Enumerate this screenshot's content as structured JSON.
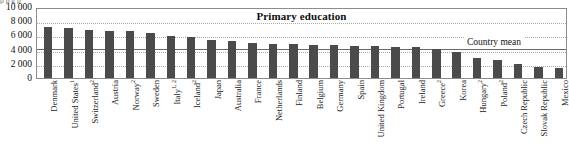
{
  "figure": {
    "top_clipped_text": "p        p                    g          p",
    "mean_label": "Country mean"
  },
  "chart_data": {
    "type": "bar",
    "title": "Primary education",
    "xlabel": "",
    "ylabel": "",
    "ylim": [
      0,
      10000
    ],
    "yticks": [
      0,
      2000,
      4000,
      6000,
      8000,
      10000
    ],
    "ytick_labels": [
      "0",
      "2 000",
      "4 000",
      "6 000",
      "8 000",
      "10 000"
    ],
    "grid": "horizontal-dotted",
    "legend": "none",
    "bar_color": "#4b4b4b",
    "annotations": [
      {
        "name": "country-mean",
        "label": "Country mean",
        "value": 4381,
        "style": "solid-line"
      }
    ],
    "categories": [
      "Denmark",
      "United States",
      "Switzerland",
      "Austria",
      "Norway",
      "Sweden",
      "Italy",
      "Iceland",
      "Japan",
      "Australia",
      "France",
      "Netherlands",
      "Finland",
      "Belgium",
      "Germany",
      "Spain",
      "United Kingdom",
      "Portugal",
      "Ireland",
      "Greece",
      "Korea",
      "Hungary",
      "Poland",
      "Czech Republic",
      "Slovak Republic",
      "Mexico"
    ],
    "category_footnotes": [
      "",
      "1",
      "2",
      "",
      "2",
      "",
      "1, 2",
      "2",
      "",
      "",
      "",
      "",
      "",
      "",
      "",
      "",
      "",
      "",
      "",
      "2",
      "",
      "2",
      "2",
      "",
      "",
      ""
    ],
    "values": [
      7200,
      7030,
      6700,
      6620,
      6580,
      6350,
      5980,
      5770,
      5400,
      5200,
      4900,
      4860,
      4760,
      4700,
      4620,
      4550,
      4450,
      4400,
      4300,
      4150,
      3650,
      2850,
      2500,
      2000,
      1600,
      1450
    ]
  }
}
